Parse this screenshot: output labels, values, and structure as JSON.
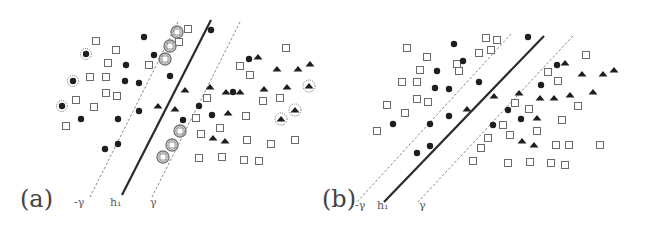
{
  "figure": {
    "colors": {
      "solid_line": "#2a2a2a",
      "dashed_line": "#777777",
      "filled_marker": "#1e1e1e",
      "square_stroke": "#6a6a6a",
      "label": "#444444"
    }
  },
  "panels": [
    {
      "id": "a",
      "label": "(a)",
      "label_pos": [
        20,
        207
      ],
      "lines": {
        "solid": {
          "name": "h1",
          "label": "h₁",
          "x1": 211,
          "y1": 20,
          "x2": 122,
          "y2": 195,
          "label_pos": [
            110,
            206
          ]
        },
        "neg": {
          "name": "-gamma",
          "label": "-γ",
          "x1": 178,
          "y1": 22,
          "x2": 90,
          "y2": 197,
          "label_pos": [
            74,
            206
          ]
        },
        "pos": {
          "name": "gamma",
          "label": "γ",
          "x1": 240,
          "y1": 22,
          "x2": 152,
          "y2": 197,
          "label_pos": [
            150,
            206
          ]
        }
      },
      "squares": [
        [
          96,
          41
        ],
        [
          116,
          50
        ],
        [
          108,
          63
        ],
        [
          90,
          77
        ],
        [
          106,
          77
        ],
        [
          106,
          93
        ],
        [
          117,
          96
        ],
        [
          76,
          100
        ],
        [
          94,
          107
        ],
        [
          66,
          126
        ],
        [
          149,
          65
        ],
        [
          179,
          42
        ],
        [
          188,
          29
        ],
        [
          240,
          66
        ],
        [
          250,
          75
        ],
        [
          207,
          98
        ],
        [
          196,
          118
        ],
        [
          220,
          128
        ],
        [
          201,
          134
        ],
        [
          246,
          116
        ],
        [
          280,
          98
        ],
        [
          286,
          48
        ],
        [
          263,
          101
        ],
        [
          247,
          140
        ],
        [
          271,
          144
        ],
        [
          295,
          140
        ],
        [
          199,
          158
        ],
        [
          222,
          157
        ],
        [
          244,
          160
        ],
        [
          259,
          161
        ]
      ],
      "dots": [
        [
          144,
          37
        ],
        [
          154,
          55
        ],
        [
          126,
          65
        ],
        [
          125,
          81
        ],
        [
          139,
          83
        ],
        [
          170,
          76
        ],
        [
          211,
          30
        ],
        [
          81,
          119
        ],
        [
          118,
          119
        ],
        [
          139,
          111
        ],
        [
          118,
          144
        ],
        [
          105,
          149
        ],
        [
          233,
          92
        ],
        [
          249,
          59
        ],
        [
          199,
          106
        ],
        [
          212,
          115
        ],
        [
          183,
          120
        ]
      ],
      "triangles": [
        [
          158,
          106
        ],
        [
          175,
          109
        ],
        [
          185,
          90
        ],
        [
          210,
          87
        ],
        [
          226,
          92
        ],
        [
          240,
          92
        ],
        [
          258,
          57
        ],
        [
          277,
          69
        ],
        [
          298,
          69
        ],
        [
          310,
          64
        ],
        [
          264,
          89
        ],
        [
          287,
          87
        ],
        [
          228,
          113
        ],
        [
          213,
          138
        ],
        [
          225,
          141
        ]
      ],
      "starred_dots": [
        [
          86,
          54
        ],
        [
          73,
          81
        ],
        [
          62,
          106
        ]
      ],
      "starred_triangles": [
        [
          309,
          86
        ],
        [
          295,
          110
        ],
        [
          281,
          119
        ]
      ],
      "circled_squares": [
        [
          177,
          32
        ],
        [
          170,
          46
        ],
        [
          165,
          59
        ],
        [
          180,
          131
        ],
        [
          172,
          145
        ],
        [
          163,
          157
        ]
      ]
    },
    {
      "id": "b",
      "label": "(b)",
      "label_pos": [
        322,
        207
      ],
      "lines": {
        "solid": {
          "name": "h1",
          "label": "h₁",
          "x1": 544,
          "y1": 36,
          "x2": 384,
          "y2": 202,
          "label_pos": [
            377,
            209
          ]
        },
        "neg": {
          "name": "-gamma",
          "label": "-γ",
          "x1": 511,
          "y1": 34,
          "x2": 357,
          "y2": 202,
          "label_pos": [
            355,
            209
          ]
        },
        "pos": {
          "name": "gamma",
          "label": "γ",
          "x1": 573,
          "y1": 36,
          "x2": 418,
          "y2": 202,
          "label_pos": [
            419,
            209
          ]
        }
      },
      "squares": [
        [
          407,
          48
        ],
        [
          427,
          57
        ],
        [
          420,
          70
        ],
        [
          402,
          82
        ],
        [
          417,
          82
        ],
        [
          417,
          99
        ],
        [
          428,
          102
        ],
        [
          387,
          105
        ],
        [
          405,
          113
        ],
        [
          377,
          131
        ],
        [
          497,
          40
        ],
        [
          486,
          38
        ],
        [
          479,
          53
        ],
        [
          491,
          50
        ],
        [
          457,
          64
        ],
        [
          459,
          71
        ],
        [
          586,
          55
        ],
        [
          548,
          72
        ],
        [
          558,
          81
        ],
        [
          515,
          103
        ],
        [
          503,
          125
        ],
        [
          529,
          109
        ],
        [
          562,
          120
        ],
        [
          578,
          106
        ],
        [
          510,
          135
        ],
        [
          488,
          138
        ],
        [
          481,
          148
        ],
        [
          537,
          131
        ],
        [
          556,
          145
        ],
        [
          569,
          145
        ],
        [
          600,
          145
        ],
        [
          473,
          161
        ],
        [
          508,
          163
        ],
        [
          530,
          162
        ],
        [
          551,
          163
        ],
        [
          565,
          165
        ]
      ],
      "dots": [
        [
          454,
          44
        ],
        [
          463,
          61
        ],
        [
          437,
          71
        ],
        [
          435,
          88
        ],
        [
          449,
          89
        ],
        [
          479,
          82
        ],
        [
          528,
          37
        ],
        [
          393,
          124
        ],
        [
          430,
          124
        ],
        [
          449,
          116
        ],
        [
          430,
          146
        ],
        [
          417,
          153
        ],
        [
          557,
          65
        ],
        [
          541,
          85
        ],
        [
          508,
          110
        ],
        [
          521,
          119
        ],
        [
          493,
          125
        ]
      ],
      "triangles": [
        [
          467,
          109
        ],
        [
          494,
          96
        ],
        [
          519,
          93
        ],
        [
          540,
          98
        ],
        [
          554,
          98
        ],
        [
          565,
          63
        ],
        [
          582,
          74
        ],
        [
          603,
          74
        ],
        [
          614,
          70
        ],
        [
          570,
          95
        ],
        [
          593,
          92
        ],
        [
          537,
          118
        ],
        [
          522,
          141
        ],
        [
          534,
          145
        ]
      ],
      "starred_dots": [],
      "starred_triangles": [],
      "circled_squares": []
    }
  ]
}
